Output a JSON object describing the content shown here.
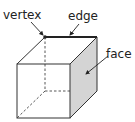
{
  "diagram": {
    "labels": {
      "vertex": "vertex",
      "edge": "edge",
      "face": "face"
    },
    "colors": {
      "stroke": "#333333",
      "shaded_face": "#d4d4d4",
      "background": "#ffffff",
      "label": "#222222"
    }
  }
}
